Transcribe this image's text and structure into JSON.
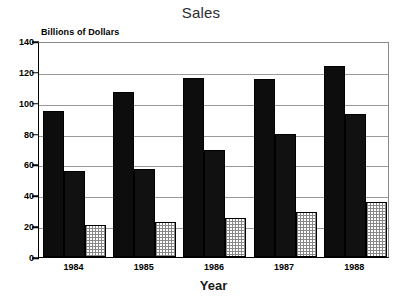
{
  "chart_data": {
    "type": "bar",
    "title": "Sales",
    "xlabel": "Year",
    "ylabel": "Billions of Dollars",
    "categories": [
      "1984",
      "1985",
      "1986",
      "1987",
      "1988"
    ],
    "series": [
      {
        "name": "series-1",
        "pattern": "solid-black",
        "values": [
          94.5,
          107,
          116,
          115.5,
          124
        ]
      },
      {
        "name": "series-2",
        "pattern": "crosshatch",
        "values": [
          56,
          57,
          69.5,
          80,
          93
        ]
      },
      {
        "name": "series-3",
        "pattern": "light-stipple",
        "values": [
          20.5,
          23,
          25,
          29,
          35.5
        ]
      }
    ],
    "ylim": [
      0,
      140
    ],
    "ytick_labels": [
      "0",
      "20",
      "40",
      "60",
      "80",
      "100",
      "120",
      "140"
    ],
    "ytick_values": [
      0,
      20,
      40,
      60,
      80,
      100,
      120,
      140
    ],
    "grid": true,
    "legend": "none",
    "colors": {
      "series_1": "#0d0d0d",
      "series_2": "#111111",
      "series_3": "#888888",
      "axis": "#000000",
      "gridline": "#9a9a9a",
      "title_text": "#2b2b2b",
      "background": "#ffffff"
    }
  }
}
